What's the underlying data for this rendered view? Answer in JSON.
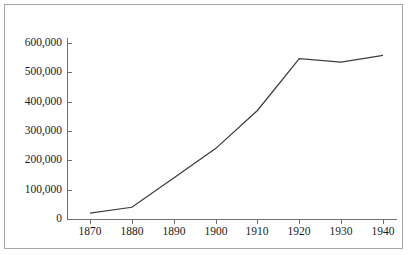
{
  "chart_data": {
    "type": "line",
    "title": "",
    "subtitle": "",
    "xlabel": "",
    "ylabel": "",
    "legend": [],
    "grid": false,
    "xlim": [
      1865,
      1945
    ],
    "ylim": [
      0,
      600000
    ],
    "x": [
      1870,
      1880,
      1890,
      1900,
      1910,
      1920,
      1930,
      1940
    ],
    "xtick_labels": [
      "1870",
      "1880",
      "1890",
      "1900",
      "1910",
      "1920",
      "1930",
      "1940"
    ],
    "ytick_values": [
      0,
      100000,
      200000,
      300000,
      400000,
      500000,
      600000
    ],
    "ytick_labels": [
      "0",
      "100,000",
      "200,000",
      "300,000",
      "400,000",
      "500,000",
      "600,000"
    ],
    "series": [
      {
        "name": "",
        "values": [
          20000,
          40000,
          140000,
          240000,
          370000,
          547000,
          535000,
          558000
        ]
      }
    ],
    "annotations": [],
    "line_color": "#3d3d3d",
    "axis_color": "#6f6f6f",
    "border_color": "#a6a6a6",
    "background_color": "#ffffff",
    "text_color": "#1a1a1a"
  }
}
